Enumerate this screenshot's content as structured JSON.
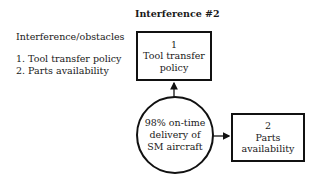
{
  "legend": {
    "title": "Interference/obstacles",
    "items": [
      "1. Tool transfer policy",
      "2. Parts availability"
    ]
  },
  "diagram": {
    "title": "Interference #2",
    "center": {
      "lines": [
        "98% on-time",
        "delivery of",
        "SM aircraft"
      ]
    },
    "boxes": [
      {
        "number": "1",
        "lines": [
          "Tool transfer",
          "policy"
        ]
      },
      {
        "number": "2",
        "lines": [
          "Parts",
          "availability"
        ]
      }
    ],
    "colors": {
      "stroke": "#111111",
      "background": "#ffffff"
    }
  }
}
